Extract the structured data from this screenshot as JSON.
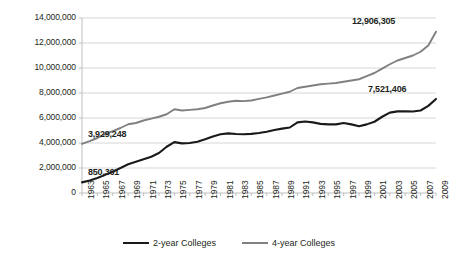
{
  "chart_data": {
    "type": "line",
    "title": "",
    "xlabel": "",
    "ylabel": "",
    "xlim": [
      1963,
      2009
    ],
    "ylim": [
      0,
      14000000
    ],
    "ytick_step": 2000000,
    "grid": true,
    "legend_position": "bottom",
    "yticks": [
      "14,000,000",
      "12,000,000",
      "10,000,000",
      "8,000,000",
      "6,000,000",
      "4,000,000",
      "2,000,000",
      "0"
    ],
    "ytick_values": [
      14000000,
      12000000,
      10000000,
      8000000,
      6000000,
      4000000,
      2000000,
      0
    ],
    "xticks": [
      "1963",
      "1965",
      "1967",
      "1969",
      "1971",
      "1973",
      "1975",
      "1977",
      "1979",
      "1981",
      "1983",
      "1985",
      "1987",
      "1989",
      "1991",
      "1993",
      "1995",
      "1997",
      "1999",
      "2001",
      "2003",
      "2005",
      "2007",
      "2009"
    ],
    "x": [
      1963,
      1964,
      1965,
      1966,
      1967,
      1968,
      1969,
      1970,
      1971,
      1972,
      1973,
      1974,
      1975,
      1976,
      1977,
      1978,
      1979,
      1980,
      1981,
      1982,
      1983,
      1984,
      1985,
      1986,
      1987,
      1988,
      1989,
      1990,
      1991,
      1992,
      1993,
      1994,
      1995,
      1996,
      1997,
      1998,
      1999,
      2000,
      2001,
      2002,
      2003,
      2004,
      2005,
      2006,
      2007,
      2008,
      2009
    ],
    "series": [
      {
        "name": "2-year Colleges",
        "color": "#1a1a1a",
        "values": [
          850361,
          1000000,
          1200000,
          1450000,
          1700000,
          2000000,
          2300000,
          2500000,
          2700000,
          2900000,
          3200000,
          3700000,
          4070000,
          3970000,
          4000000,
          4100000,
          4300000,
          4520000,
          4700000,
          4770000,
          4720000,
          4700000,
          4730000,
          4800000,
          4900000,
          5040000,
          5150000,
          5240000,
          5650000,
          5720000,
          5650000,
          5530000,
          5490000,
          5490000,
          5600000,
          5490000,
          5340000,
          5490000,
          5700000,
          6100000,
          6430000,
          6530000,
          6530000,
          6520000,
          6600000,
          6970000,
          7521406
        ]
      },
      {
        "name": "4-year Colleges",
        "color": "#808080",
        "values": [
          3929248,
          4150000,
          4400000,
          4700000,
          4950000,
          5200000,
          5500000,
          5600000,
          5800000,
          5950000,
          6100000,
          6300000,
          6700000,
          6600000,
          6650000,
          6700000,
          6800000,
          7000000,
          7180000,
          7300000,
          7380000,
          7350000,
          7400000,
          7530000,
          7650000,
          7800000,
          7950000,
          8100000,
          8400000,
          8500000,
          8600000,
          8700000,
          8750000,
          8800000,
          8900000,
          9000000,
          9100000,
          9350000,
          9600000,
          9950000,
          10300000,
          10600000,
          10800000,
          11000000,
          11300000,
          11800000,
          12906305
        ]
      }
    ],
    "annotations": [
      {
        "text": "3,929,248",
        "series": "4-year Colleges",
        "x": 1963,
        "value": 3929248
      },
      {
        "text": "850,361",
        "series": "2-year Colleges",
        "x": 1963,
        "value": 850361
      },
      {
        "text": "12,906,305",
        "series": "4-year Colleges",
        "x": 2009,
        "value": 12906305
      },
      {
        "text": "7,521,406",
        "series": "2-year Colleges",
        "x": 2009,
        "value": 7521406
      }
    ]
  },
  "legend": {
    "items": [
      {
        "label": "2-year Colleges",
        "color": "#1a1a1a"
      },
      {
        "label": "4-year Colleges",
        "color": "#808080"
      }
    ]
  }
}
